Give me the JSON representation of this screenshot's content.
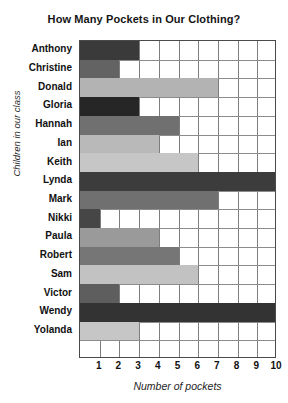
{
  "chart_data": {
    "type": "bar",
    "orientation": "horizontal",
    "title": "How Many Pockets in Our Clothing?",
    "xlabel": "Number of pockets",
    "ylabel": "Children in our class",
    "categories": [
      "Anthony",
      "Christine",
      "Donald",
      "Gloria",
      "Hannah",
      "Ian",
      "Keith",
      "Lynda",
      "Mark",
      "Nikki",
      "Paula",
      "Robert",
      "Sam",
      "Victor",
      "Wendy",
      "Yolanda"
    ],
    "values": [
      3,
      2,
      7,
      3,
      5,
      4,
      6,
      10,
      7,
      1,
      4,
      5,
      6,
      2,
      10,
      3
    ],
    "xticks": [
      1,
      2,
      3,
      4,
      5,
      6,
      7,
      8,
      9,
      10
    ],
    "xlim": [
      0,
      10
    ],
    "grid": true,
    "legend": "none",
    "bar_colors": [
      "#3a3a3a",
      "#636363",
      "#b3b3b3",
      "#262626",
      "#707070",
      "#b9b9b9",
      "#c6c6c6",
      "#3c3c3c",
      "#707070",
      "#464646",
      "#9a9a9a",
      "#767676",
      "#c2c2c2",
      "#5e5e5e",
      "#333333",
      "#c6c6c6"
    ]
  }
}
